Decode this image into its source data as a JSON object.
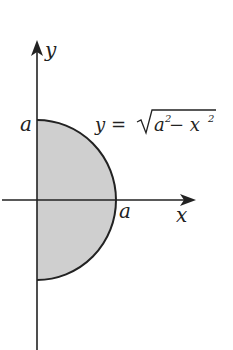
{
  "figure": {
    "type": "semicircle-region",
    "x_axis_label": "x",
    "y_axis_label": "y",
    "top_intercept_label": "a",
    "right_intercept_label": "a",
    "equation": {
      "lhs": "y = ",
      "radicand_a": "a",
      "exp1": "2",
      "minus": " − x",
      "exp2": "2"
    },
    "colors": {
      "fill": "#cfcfcf",
      "stroke": "#222222"
    }
  }
}
